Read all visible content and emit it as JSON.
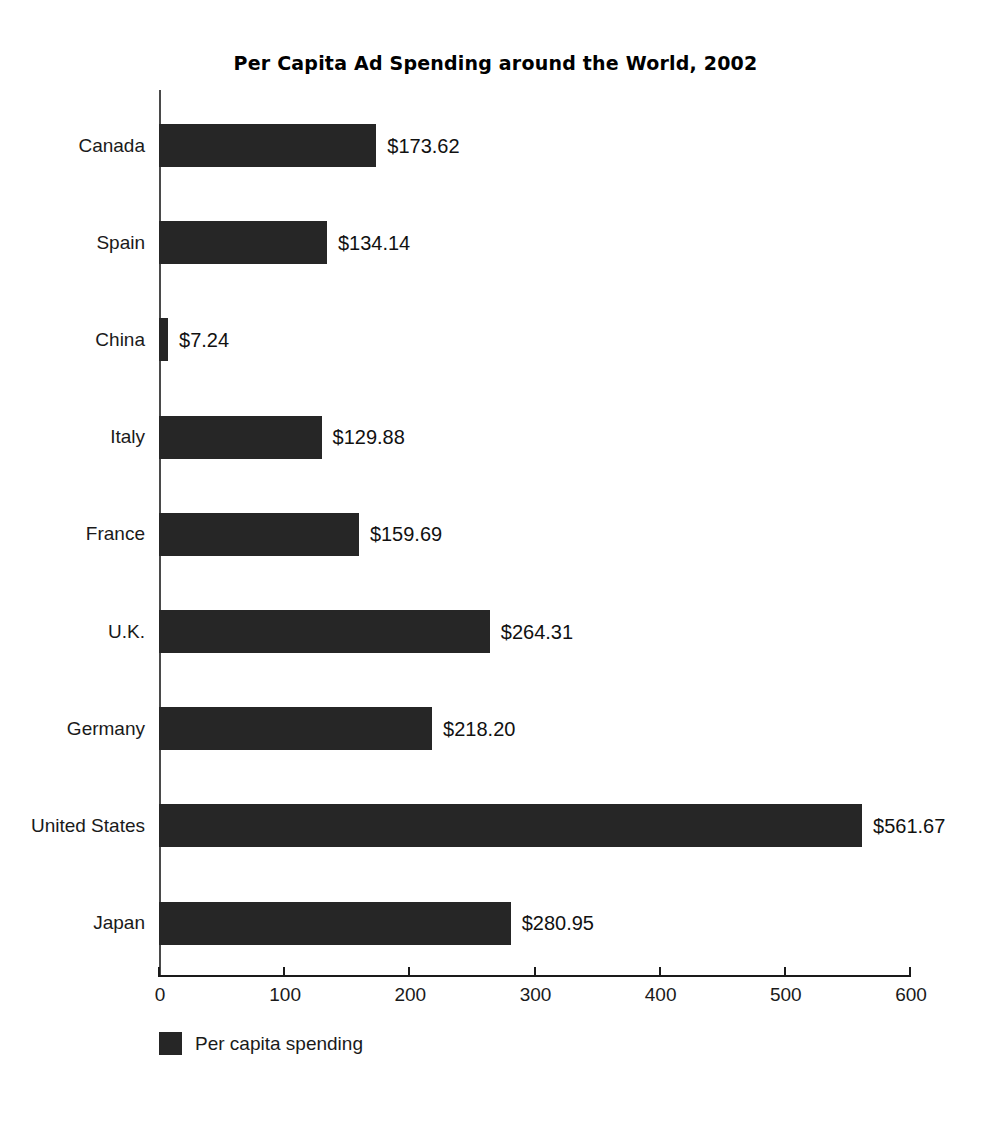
{
  "chart_data": {
    "type": "bar",
    "orientation": "horizontal",
    "title": "Per Capita Ad Spending around the World, 2002",
    "xlabel": "",
    "ylabel": "",
    "xlim": [
      0,
      600
    ],
    "xticks": [
      "0",
      "100",
      "200",
      "300",
      "400",
      "500",
      "600"
    ],
    "grid": false,
    "legend_position": "bottom-left",
    "legend": [
      {
        "label": "Per capita spending",
        "color": "#262626"
      }
    ],
    "categories": [
      "Canada",
      "Spain",
      "China",
      "Italy",
      "France",
      "U.K.",
      "Germany",
      "United States",
      "Japan"
    ],
    "values": [
      173.62,
      134.14,
      7.24,
      129.88,
      159.69,
      264.31,
      218.2,
      561.67,
      280.95
    ],
    "value_labels": [
      "$173.62",
      "$134.14",
      "$7.24",
      "$129.88",
      "$159.69",
      "$264.31",
      "$218.20",
      "$561.67",
      "$280.95"
    ],
    "series": [
      {
        "name": "Per capita spending",
        "values": [
          173.62,
          134.14,
          7.24,
          129.88,
          159.69,
          264.31,
          218.2,
          561.67,
          280.95
        ]
      }
    ]
  },
  "colors": {
    "bar": "#262626",
    "axis": "#1a1a1a",
    "text": "#1a1a1a",
    "background": "#ffffff"
  }
}
